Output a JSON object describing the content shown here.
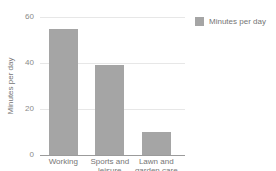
{
  "chart_data": {
    "type": "bar",
    "title": "",
    "categories": [
      "Working",
      "Sports and leisure",
      "Lawn and garden care"
    ],
    "values": [
      55,
      39,
      10
    ],
    "series": [
      {
        "name": "Minutes per day",
        "values": [
          55,
          39,
          10
        ]
      }
    ],
    "xlabel": "",
    "ylabel": "Minutes per day",
    "ylim": [
      0,
      60
    ],
    "yticks": [
      0,
      20,
      40,
      60
    ],
    "grid": true,
    "legend": {
      "position": "top-right",
      "label": "Minutes per day"
    },
    "colors": {
      "bar": "#a5a5a5",
      "grid": "#e7e7e7",
      "axis": "#9b9b9b",
      "tick_text": "#8a8a8a",
      "label_text": "#757575",
      "background": "#ffffff"
    }
  }
}
